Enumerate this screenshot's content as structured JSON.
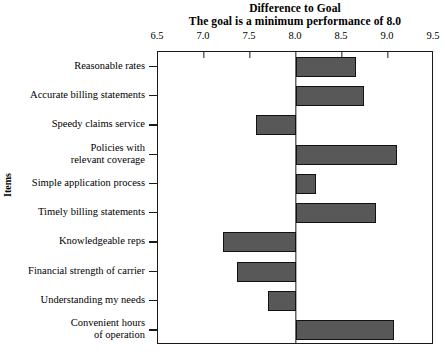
{
  "chart_data": {
    "type": "bar",
    "orientation": "horizontal",
    "title": "Difference to Goal",
    "subtitle": "The goal is a minimum performance of 8.0",
    "xlabel": "",
    "ylabel": "Items",
    "xlim": [
      6.5,
      9.5
    ],
    "xticks": [
      6.5,
      7.0,
      7.5,
      8.0,
      8.5,
      9.0,
      9.5
    ],
    "xtick_labels": [
      "6.5",
      "7.0",
      "7.5",
      "8.0",
      "8.5",
      "9.0",
      "9.5"
    ],
    "xaxis_position": "top",
    "grid": false,
    "legend": false,
    "reference_line": 8.0,
    "baseline": 8.0,
    "bar_color": "#585858",
    "bar_edge_color": "#121212",
    "frame_color": "#1a1a1a",
    "categories": [
      "Reasonable rates",
      "Accurate billing statements",
      "Speedy claims service",
      "Policies with\nrelevant coverage",
      "Simple application process",
      "Timely billing statements",
      "Knowledgeable reps",
      "Financial strength of carrier",
      "Understanding my needs",
      "Convenient hours\nof operation"
    ],
    "values": [
      8.65,
      8.74,
      7.57,
      9.1,
      8.22,
      8.87,
      7.21,
      7.36,
      7.7,
      9.07
    ],
    "differences": [
      0.65,
      0.74,
      -0.43,
      1.1,
      0.22,
      0.87,
      -0.79,
      -0.64,
      -0.3,
      1.07
    ]
  }
}
